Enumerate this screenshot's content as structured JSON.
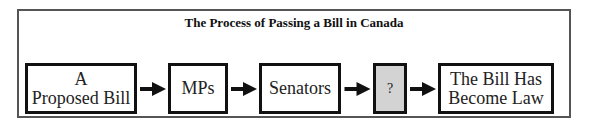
{
  "diagram": {
    "title": "The Process of Passing a Bill in Canada",
    "steps": [
      {
        "label_line1": "A",
        "label_line2": "Proposed Bill"
      },
      {
        "label": "MPs"
      },
      {
        "label": "Senators"
      },
      {
        "label": "?"
      },
      {
        "label_line1": "The Bill Has",
        "label_line2": "Become Law"
      }
    ],
    "colors": {
      "unknown_step_fill": "#d3d3d3",
      "border": "#111111"
    }
  }
}
